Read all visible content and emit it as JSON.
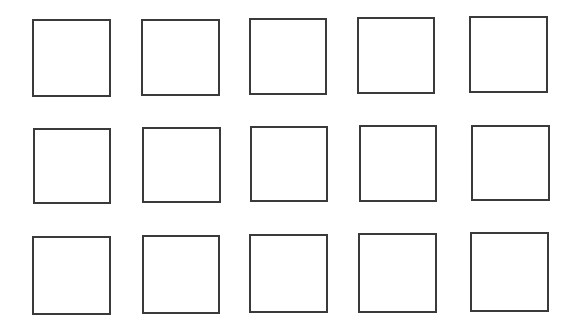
{
  "grid": {
    "rows": 3,
    "cols": 5,
    "stroke_color": "#3a3a3a",
    "background": "#ffffff",
    "squares": [
      {
        "row": 1,
        "col": 1,
        "x": 32,
        "y": 19,
        "w": 79,
        "h": 78
      },
      {
        "row": 1,
        "col": 2,
        "x": 141,
        "y": 19,
        "w": 79,
        "h": 77
      },
      {
        "row": 1,
        "col": 3,
        "x": 249,
        "y": 18,
        "w": 78,
        "h": 77
      },
      {
        "row": 1,
        "col": 4,
        "x": 357,
        "y": 17,
        "w": 78,
        "h": 77
      },
      {
        "row": 1,
        "col": 5,
        "x": 469,
        "y": 16,
        "w": 79,
        "h": 77
      },
      {
        "row": 2,
        "col": 1,
        "x": 33,
        "y": 128,
        "w": 78,
        "h": 76
      },
      {
        "row": 2,
        "col": 2,
        "x": 142,
        "y": 127,
        "w": 79,
        "h": 76
      },
      {
        "row": 2,
        "col": 3,
        "x": 250,
        "y": 126,
        "w": 78,
        "h": 76
      },
      {
        "row": 2,
        "col": 4,
        "x": 359,
        "y": 125,
        "w": 78,
        "h": 77
      },
      {
        "row": 2,
        "col": 5,
        "x": 471,
        "y": 125,
        "w": 79,
        "h": 76
      },
      {
        "row": 3,
        "col": 1,
        "x": 32,
        "y": 236,
        "w": 79,
        "h": 79
      },
      {
        "row": 3,
        "col": 2,
        "x": 142,
        "y": 235,
        "w": 78,
        "h": 79
      },
      {
        "row": 3,
        "col": 3,
        "x": 249,
        "y": 234,
        "w": 79,
        "h": 79
      },
      {
        "row": 3,
        "col": 4,
        "x": 358,
        "y": 233,
        "w": 79,
        "h": 80
      },
      {
        "row": 3,
        "col": 5,
        "x": 470,
        "y": 232,
        "w": 79,
        "h": 80
      }
    ]
  }
}
